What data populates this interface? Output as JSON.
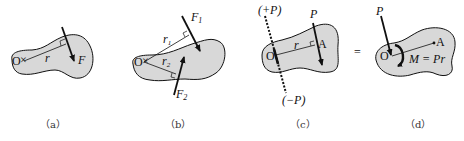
{
  "colors": {
    "body_fill": "#d8d8d8",
    "stroke": "#111111",
    "background": "#ffffff"
  },
  "panels": [
    {
      "id": "a",
      "caption": "（a）",
      "labels": {
        "origin": "O",
        "radius": "r",
        "force": "F"
      }
    },
    {
      "id": "b",
      "caption": "（b）",
      "labels": {
        "origin": "O",
        "r1": "r",
        "r1_sub": "1",
        "r2": "r",
        "r2_sub": "2",
        "f1": "F",
        "f1_sub": "1",
        "f2": "F",
        "f2_sub": "2"
      }
    },
    {
      "id": "c",
      "caption": "（c）",
      "labels": {
        "origin": "O",
        "radius": "r",
        "point": "A",
        "force": "P",
        "plus_p": "(+P)",
        "minus_p": "(−P)"
      }
    },
    {
      "id": "d",
      "caption": "（d）",
      "labels": {
        "origin": "O",
        "point": "A",
        "force": "P",
        "moment": "M = Pr"
      }
    }
  ],
  "equals_sign": "="
}
